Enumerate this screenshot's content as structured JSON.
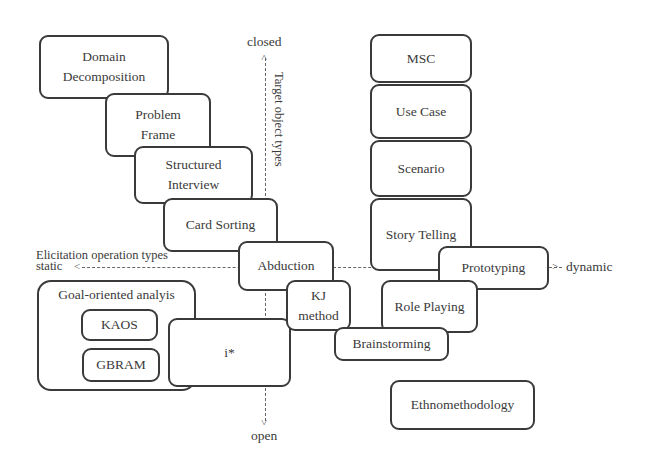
{
  "axes": {
    "vertical": {
      "label": "Target object types",
      "top": "closed",
      "bottom": "open"
    },
    "horizontal": {
      "label": "Elicitation operation types",
      "left": "static",
      "right": "dynamic"
    }
  },
  "boxes": {
    "domain_decomposition": {
      "line1": "Domain",
      "line2": "Decomposition"
    },
    "problem_frame": {
      "line1": "Problem",
      "line2": "Frame"
    },
    "structured_interview": {
      "line1": "Structured",
      "line2": "Interview"
    },
    "card_sorting": {
      "label": "Card Sorting"
    },
    "abduction": {
      "label": "Abduction"
    },
    "kj_method": {
      "line1": "KJ",
      "line2": "method"
    },
    "brainstorming": {
      "label": "Brainstorming"
    },
    "i_star": {
      "label": "i*"
    },
    "msc": {
      "label": "MSC"
    },
    "use_case": {
      "label": "Use Case"
    },
    "scenario": {
      "label": "Scenario"
    },
    "story_telling": {
      "label": "Story Telling"
    },
    "prototyping": {
      "label": "Prototyping"
    },
    "role_playing": {
      "label": "Role Playing"
    },
    "ethnomethodology": {
      "label": "Ethnomethodology"
    }
  },
  "group": {
    "title": "Goal-oriented analyis",
    "items": [
      {
        "label": "KAOS"
      },
      {
        "label": "GBRAM"
      }
    ]
  },
  "colors": {
    "stroke": "#3a3a3a",
    "background": "#ffffff",
    "axis": "#666666"
  }
}
